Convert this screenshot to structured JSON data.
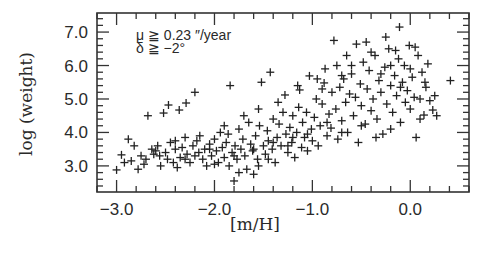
{
  "chart_data": {
    "type": "scatter",
    "title": "",
    "xlabel": "[m/H]",
    "ylabel": "log (weight)",
    "xlim": [
      -3.2,
      0.6
    ],
    "ylim": [
      2.22,
      7.57
    ],
    "xticks": [
      -3.0,
      -2.0,
      -1.0,
      0.0
    ],
    "xtick_labels": [
      "−3.0",
      "−2.0",
      "−1.0",
      "0.0"
    ],
    "xminor_step": 0.2,
    "yticks": [
      3.0,
      4.0,
      5.0,
      6.0,
      7.0
    ],
    "ytick_labels": [
      "3.0",
      "4.0",
      "5.0",
      "6.0",
      "7.0"
    ],
    "yminor_step": 0.2,
    "grid": false,
    "marker": "plus",
    "annotations": [
      {
        "text": "μ ≧ 0.23 ″/year",
        "position": "top-left"
      },
      {
        "text": "δ ≧ −2°",
        "position": "top-left"
      }
    ],
    "series": [
      {
        "name": "stars",
        "points": [
          [
            -3.0,
            2.88
          ],
          [
            -2.95,
            3.33
          ],
          [
            -2.88,
            3.8
          ],
          [
            -2.92,
            3.1
          ],
          [
            -2.85,
            3.15
          ],
          [
            -2.82,
            3.6
          ],
          [
            -2.78,
            2.9
          ],
          [
            -2.75,
            3.3
          ],
          [
            -2.72,
            3.05
          ],
          [
            -2.7,
            3.2
          ],
          [
            -2.68,
            4.5
          ],
          [
            -2.64,
            3.5
          ],
          [
            -2.62,
            3.35
          ],
          [
            -2.6,
            3.45
          ],
          [
            -2.58,
            3.6
          ],
          [
            -2.56,
            3.3
          ],
          [
            -2.55,
            3.0
          ],
          [
            -2.52,
            4.58
          ],
          [
            -2.5,
            3.4
          ],
          [
            -2.48,
            3.2
          ],
          [
            -2.47,
            4.82
          ],
          [
            -2.45,
            3.7
          ],
          [
            -2.42,
            3.1
          ],
          [
            -2.4,
            3.5
          ],
          [
            -2.38,
            2.95
          ],
          [
            -2.36,
            4.67
          ],
          [
            -2.35,
            3.25
          ],
          [
            -2.33,
            3.55
          ],
          [
            -2.3,
            3.85
          ],
          [
            -2.29,
            4.88
          ],
          [
            -2.28,
            3.35
          ],
          [
            -2.25,
            3.1
          ],
          [
            -2.22,
            3.6
          ],
          [
            -2.2,
            5.2
          ],
          [
            -2.18,
            3.75
          ],
          [
            -2.16,
            3.4
          ],
          [
            -2.15,
            3.9
          ],
          [
            -2.12,
            3.2
          ],
          [
            -2.1,
            3.5
          ],
          [
            -2.08,
            3.0
          ],
          [
            -2.05,
            3.65
          ],
          [
            -2.03,
            3.3
          ],
          [
            -2.0,
            3.8
          ],
          [
            -1.98,
            3.45
          ],
          [
            -1.96,
            3.1
          ],
          [
            -1.94,
            4.0
          ],
          [
            -1.92,
            3.55
          ],
          [
            -1.9,
            3.25
          ],
          [
            -1.88,
            3.7
          ],
          [
            -1.86,
            3.95
          ],
          [
            -1.84,
            5.4
          ],
          [
            -1.82,
            3.4
          ],
          [
            -1.8,
            2.55
          ],
          [
            -1.79,
            3.6
          ],
          [
            -1.77,
            3.2
          ],
          [
            -1.75,
            4.1
          ],
          [
            -1.73,
            3.5
          ],
          [
            -1.71,
            3.8
          ],
          [
            -1.69,
            3.3
          ],
          [
            -1.67,
            2.9
          ],
          [
            -1.65,
            4.3
          ],
          [
            -1.63,
            3.65
          ],
          [
            -1.61,
            3.45
          ],
          [
            -1.6,
            2.75
          ],
          [
            -1.58,
            3.9
          ],
          [
            -1.56,
            3.2
          ],
          [
            -1.54,
            4.2
          ],
          [
            -1.52,
            5.5
          ],
          [
            -1.5,
            3.6
          ],
          [
            -1.48,
            3.35
          ],
          [
            -1.46,
            4.05
          ],
          [
            -1.45,
            3.75
          ],
          [
            -1.43,
            5.8
          ],
          [
            -1.41,
            3.5
          ],
          [
            -1.4,
            4.4
          ],
          [
            -1.38,
            3.1
          ],
          [
            -1.36,
            3.85
          ],
          [
            -1.34,
            4.25
          ],
          [
            -1.32,
            3.6
          ],
          [
            -1.3,
            4.6
          ],
          [
            -1.28,
            5.12
          ],
          [
            -1.27,
            3.95
          ],
          [
            -1.25,
            3.4
          ],
          [
            -1.23,
            4.15
          ],
          [
            -1.21,
            3.7
          ],
          [
            -1.2,
            4.5
          ],
          [
            -1.18,
            3.25
          ],
          [
            -1.16,
            4.0
          ],
          [
            -1.14,
            4.75
          ],
          [
            -1.13,
            5.27
          ],
          [
            -1.11,
            3.55
          ],
          [
            -1.1,
            4.3
          ],
          [
            -1.08,
            3.85
          ],
          [
            -1.06,
            4.6
          ],
          [
            -1.05,
            3.45
          ],
          [
            -1.03,
            5.69
          ],
          [
            -1.01,
            4.1
          ],
          [
            -1.0,
            3.75
          ],
          [
            -0.98,
            4.45
          ],
          [
            -0.96,
            5.0
          ],
          [
            -0.94,
            3.6
          ],
          [
            -0.92,
            4.2
          ],
          [
            -0.9,
            4.85
          ],
          [
            -0.88,
            5.48
          ],
          [
            -0.87,
            5.9
          ],
          [
            -0.85,
            3.9
          ],
          [
            -0.83,
            4.55
          ],
          [
            -0.81,
            4.13
          ],
          [
            -0.8,
            5.2
          ],
          [
            -0.78,
            6.75
          ],
          [
            -0.76,
            4.7
          ],
          [
            -0.74,
            3.8
          ],
          [
            -0.72,
            5.35
          ],
          [
            -0.7,
            4.35
          ],
          [
            -0.68,
            5.6
          ],
          [
            -0.66,
            4.9
          ],
          [
            -0.64,
            4.0
          ],
          [
            -0.62,
            5.15
          ],
          [
            -0.6,
            5.75
          ],
          [
            -0.58,
            4.5
          ],
          [
            -0.56,
            5.05
          ],
          [
            -0.55,
            6.64
          ],
          [
            -0.53,
            3.7
          ],
          [
            -0.51,
            5.45
          ],
          [
            -0.5,
            4.8
          ],
          [
            -0.48,
            6.1
          ],
          [
            -0.46,
            4.25
          ],
          [
            -0.44,
            5.3
          ],
          [
            -0.42,
            5.85
          ],
          [
            -0.4,
            4.65
          ],
          [
            -0.38,
            5.0
          ],
          [
            -0.36,
            6.3
          ],
          [
            -0.34,
            4.4
          ],
          [
            -0.32,
            5.55
          ],
          [
            -0.3,
            5.2
          ],
          [
            -0.28,
            3.95
          ],
          [
            -0.26,
            5.95
          ],
          [
            -0.24,
            4.85
          ],
          [
            -0.22,
            6.5
          ],
          [
            -0.2,
            5.4
          ],
          [
            -0.18,
            4.6
          ],
          [
            -0.16,
            5.7
          ],
          [
            -0.14,
            5.1
          ],
          [
            -0.12,
            6.2
          ],
          [
            -0.11,
            7.15
          ],
          [
            -0.1,
            4.3
          ],
          [
            -0.08,
            5.5
          ],
          [
            -0.06,
            6.0
          ],
          [
            -0.05,
            4.9
          ],
          [
            -0.03,
            5.25
          ],
          [
            -0.01,
            6.6
          ],
          [
            0.0,
            4.7
          ],
          [
            0.02,
            5.65
          ],
          [
            0.04,
            5.05
          ],
          [
            0.06,
            3.85
          ],
          [
            0.08,
            6.3
          ],
          [
            0.1,
            5.0
          ],
          [
            0.12,
            5.8
          ],
          [
            0.14,
            4.52
          ],
          [
            0.16,
            5.35
          ],
          [
            0.18,
            6.05
          ],
          [
            0.2,
            4.95
          ],
          [
            0.23,
            4.67
          ],
          [
            0.25,
            5.1
          ],
          [
            0.27,
            4.5
          ],
          [
            0.41,
            5.55
          ],
          [
            -1.9,
            4.2
          ],
          [
            -1.7,
            4.5
          ],
          [
            -1.55,
            4.7
          ],
          [
            -1.35,
            4.9
          ],
          [
            -1.15,
            5.4
          ],
          [
            -0.95,
            5.6
          ],
          [
            -0.75,
            6.0
          ],
          [
            -0.65,
            6.3
          ],
          [
            -0.45,
            6.7
          ],
          [
            -0.25,
            6.85
          ],
          [
            -0.15,
            6.45
          ],
          [
            0.05,
            6.55
          ],
          [
            -2.4,
            3.75
          ],
          [
            -2.2,
            3.3
          ],
          [
            -2.0,
            3.05
          ],
          [
            -1.85,
            3.0
          ],
          [
            -1.75,
            2.8
          ],
          [
            -1.55,
            3.0
          ],
          [
            -1.45,
            3.2
          ],
          [
            -1.25,
            3.6
          ],
          [
            -1.05,
            3.95
          ],
          [
            -0.85,
            4.3
          ],
          [
            -0.7,
            4.0
          ],
          [
            -0.5,
            4.2
          ],
          [
            -0.35,
            3.85
          ],
          [
            -0.2,
            4.1
          ],
          [
            0.1,
            4.4
          ],
          [
            -0.6,
            6.0
          ],
          [
            -0.4,
            6.4
          ],
          [
            -0.2,
            6.0
          ],
          [
            -1.2,
            3.85
          ],
          [
            -1.4,
            3.7
          ],
          [
            -1.6,
            3.5
          ],
          [
            -1.8,
            3.3
          ],
          [
            -2.05,
            3.5
          ],
          [
            -2.3,
            3.2
          ],
          [
            -0.9,
            5.3
          ],
          [
            -0.7,
            5.7
          ],
          [
            -0.3,
            5.75
          ],
          [
            0.0,
            5.9
          ],
          [
            0.15,
            5.5
          ],
          [
            -0.1,
            5.35
          ]
        ]
      }
    ]
  }
}
